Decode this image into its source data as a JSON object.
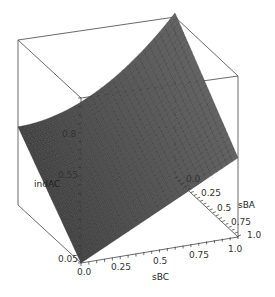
{
  "chart_data": {
    "type": "surface3d",
    "title": "",
    "axes": {
      "x": {
        "label": "sBC",
        "ticks": [
          "0.0",
          "0.25",
          "0.5",
          "0.75",
          "1.0"
        ],
        "range": [
          0,
          1
        ]
      },
      "y": {
        "label": "sBA",
        "ticks": [
          "0.0",
          "0.25",
          "0.5",
          "0.75",
          "1.0"
        ],
        "range": [
          0,
          1
        ]
      },
      "z": {
        "label": "indAC",
        "ticks": [
          "0.05",
          "0.55",
          "0.8"
        ],
        "range": [
          0.05,
          1.0
        ]
      }
    },
    "surface": {
      "description": "Mesh surface; lowest near sBC=0,sBA=1 (~0.05), highest near sBC=1,sBA=0 (~1.0); saddle-like curvature",
      "corners": [
        {
          "sBC": 0.0,
          "sBA": 0.0,
          "indAC": 0.5
        },
        {
          "sBC": 1.0,
          "sBA": 0.0,
          "indAC": 1.0
        },
        {
          "sBC": 0.0,
          "sBA": 1.0,
          "indAC": 0.05
        },
        {
          "sBC": 1.0,
          "sBA": 1.0,
          "indAC": 0.5
        }
      ],
      "color": "#555555",
      "grid": true
    },
    "bounding_box": true
  },
  "labels": {
    "x_axis": "sBC",
    "y_axis": "sBA",
    "z_axis": "indAC",
    "x_ticks": [
      "0.0",
      "0.25",
      "0.5",
      "0.75",
      "1.0"
    ],
    "y_ticks": [
      "0.0",
      "0.25",
      "0.5",
      "0.75",
      "1.0"
    ],
    "z_ticks": [
      "0.05",
      "0.55",
      "0.8"
    ]
  }
}
